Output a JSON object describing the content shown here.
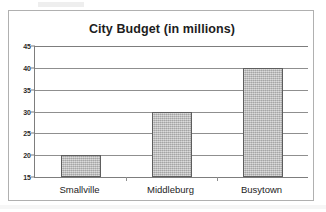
{
  "chart_data": {
    "type": "bar",
    "title": "City Budget (in millions)",
    "xlabel": "",
    "ylabel": "",
    "categories": [
      "Smallville",
      "Middleburg",
      "Busytown"
    ],
    "values": [
      20,
      30,
      40
    ],
    "series": [
      {
        "name": "City Budget",
        "values": [
          20,
          30,
          40
        ]
      }
    ],
    "ylim": [
      15,
      45
    ],
    "ytick_labels": [
      "45",
      "40",
      "35",
      "30",
      "25",
      "20",
      "15"
    ],
    "ytick_values": [
      45,
      40,
      35,
      30,
      25,
      20,
      15
    ],
    "ytick_step": 5,
    "grid": "horizontal",
    "legend": "none",
    "bar_fill_color": "#bcbcbc",
    "bar_border_color": "#5e5e5e",
    "gridline_color": "#8f8f8f",
    "axis_color": "#7d7d7d",
    "frame_color": "#b0b0b0",
    "background_color": "#ffffff",
    "title_color": "#1d1d1d"
  }
}
